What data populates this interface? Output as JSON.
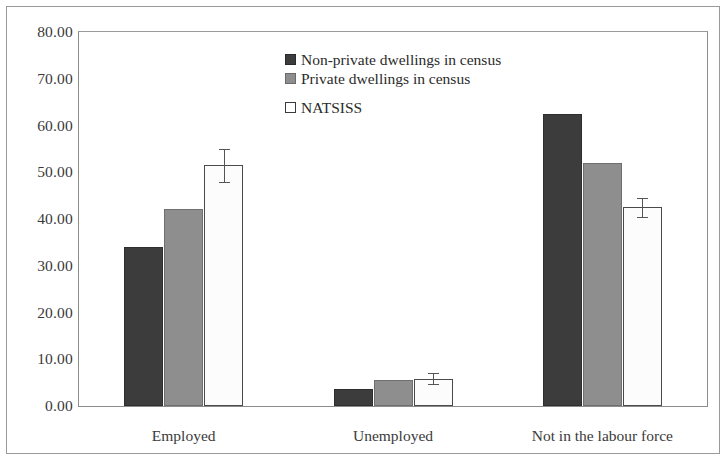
{
  "chart_data": {
    "type": "bar",
    "title": "",
    "xlabel": "",
    "ylabel": "",
    "ylim": [
      0,
      80
    ],
    "ytick_step": 10,
    "ytick_labels": [
      "80.00",
      "70.00",
      "60.00",
      "50.00",
      "40.00",
      "30.00",
      "20.00",
      "10.00",
      "0.00"
    ],
    "ytick_values": [
      80,
      70,
      60,
      50,
      40,
      30,
      20,
      10,
      0
    ],
    "grid": false,
    "legend_position": "inside-top-center",
    "categories": [
      "Employed",
      "Unemployed",
      "Not in the labour force"
    ],
    "series": [
      {
        "name": "Non-private dwellings in census",
        "color": "#3c3c3c",
        "values": [
          34.0,
          3.6,
          62.4
        ],
        "errors": [
          null,
          null,
          null
        ]
      },
      {
        "name": "Private dwellings in census",
        "color": "#8e8e8e",
        "values": [
          42.2,
          5.5,
          52.0
        ],
        "errors": [
          null,
          null,
          null
        ]
      },
      {
        "name": "NATSISS",
        "color": "#ffffff",
        "values": [
          51.5,
          5.8,
          42.5
        ],
        "errors": [
          3.5,
          1.2,
          2.0
        ]
      }
    ]
  },
  "legend": {
    "items": [
      {
        "label": "Non-private dwellings in census",
        "swatch": "dark-square-icon"
      },
      {
        "label": "Private dwellings in census",
        "swatch": "gray-square-icon"
      },
      {
        "label": "NATSISS",
        "swatch": "white-square-icon"
      }
    ]
  }
}
